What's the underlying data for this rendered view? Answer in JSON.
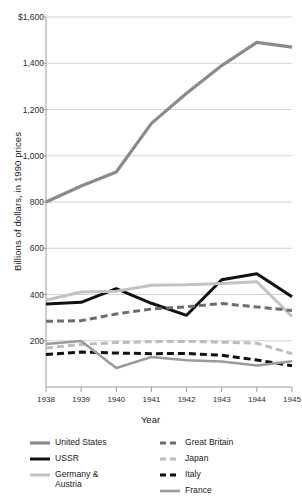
{
  "chart_data": {
    "type": "line",
    "title": "",
    "xlabel": "Year",
    "ylabel": "Billions of dollars, in 1990 prices",
    "x": [
      1938,
      1939,
      1940,
      1941,
      1942,
      1943,
      1944,
      1945
    ],
    "xtick_labels": [
      "1938",
      "1939",
      "1940",
      "1941",
      "1942",
      "1943",
      "1944",
      "1945"
    ],
    "ytick_labels": [
      "$1,600",
      "1,400",
      "1,200",
      "1,000",
      "800",
      "600",
      "400",
      "200"
    ],
    "ytick_values": [
      1600,
      1400,
      1200,
      1000,
      800,
      600,
      400,
      200
    ],
    "ylim": [
      0,
      1600
    ],
    "xlim": [
      1938,
      1945
    ],
    "grid": "horizontal",
    "legend_position": "below",
    "series": [
      {
        "name": "United States",
        "color": "#8a8a8a",
        "style": "solid",
        "width": 3.2,
        "values": [
          800,
          869,
          930,
          1140,
          1270,
          1390,
          1490,
          1470
        ]
      },
      {
        "name": "USSR",
        "color": "#111111",
        "style": "solid",
        "width": 3.0,
        "values": [
          359,
          366,
          425,
          362,
          310,
          464,
          490,
          390
        ]
      },
      {
        "name": "Germany & Austria",
        "color": "#c2c2c2",
        "style": "solid",
        "width": 3.0,
        "values": [
          375,
          411,
          414,
          440,
          442,
          448,
          455,
          305
        ]
      },
      {
        "name": "Great Britain",
        "color": "#6d6d6d",
        "style": "dashed",
        "width": 3.0,
        "values": [
          284,
          287,
          316,
          337,
          347,
          361,
          346,
          331
        ]
      },
      {
        "name": "Japan",
        "color": "#bdbdbd",
        "style": "dashed",
        "width": 3.0,
        "values": [
          169,
          184,
          192,
          196,
          197,
          194,
          189,
          144
        ]
      },
      {
        "name": "Italy",
        "color": "#111111",
        "style": "dashed",
        "width": 3.0,
        "values": [
          141,
          151,
          147,
          144,
          145,
          137,
          117,
          92
        ]
      },
      {
        "name": "France",
        "color": "#9b9b9b",
        "style": "solid",
        "width": 2.6,
        "values": [
          186,
          199,
          82,
          130,
          116,
          110,
          93,
          111
        ]
      }
    ]
  },
  "legend": {
    "left_items": [
      {
        "label": "United States",
        "series": "United States"
      },
      {
        "label": "USSR",
        "series": "USSR"
      },
      {
        "label": "Germany &\nAustria",
        "series": "Germany & Austria"
      }
    ],
    "right_items": [
      {
        "label": "Great Britain",
        "series": "Great Britain"
      },
      {
        "label": "Japan",
        "series": "Japan"
      },
      {
        "label": "Italy",
        "series": "Italy"
      },
      {
        "label": "France",
        "series": "France"
      }
    ]
  },
  "colors": {
    "background": "#ffffff",
    "grid": "#d4d4d4",
    "axis": "#9a9a9a",
    "text": "#1a1a1a"
  }
}
